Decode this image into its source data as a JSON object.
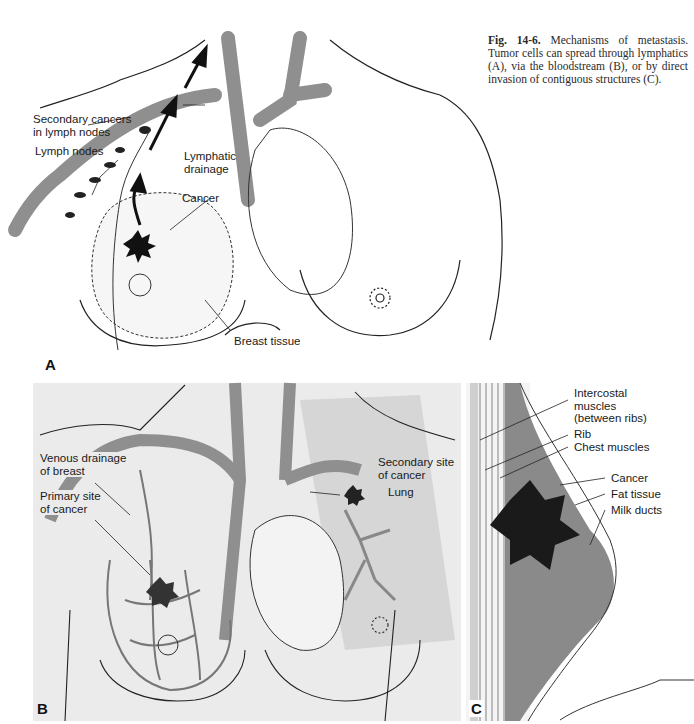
{
  "figure": {
    "number": "Fig. 14-6.",
    "caption": "Mechanisms of metastasis. Tumor cells can spread through lymphatics (A), via the bloodstream (B), or by direct invasion of contiguous structures (C)."
  },
  "panels": {
    "A": {
      "letter": "A",
      "labels": {
        "secondary_cancers_1": "Secondary cancers",
        "secondary_cancers_2": "in lymph nodes",
        "lymph_nodes": "Lymph nodes",
        "lymphatic_1": "Lymphatic",
        "lymphatic_2": "drainage",
        "cancer": "Cancer",
        "breast_tissue": "Breast tissue"
      }
    },
    "B": {
      "letter": "B",
      "labels": {
        "venous_1": "Venous drainage",
        "venous_2": "of breast",
        "primary_1": "Primary site",
        "primary_2": "of cancer",
        "secondary_1": "Secondary site",
        "secondary_2": "of cancer",
        "lung": "Lung"
      }
    },
    "C": {
      "letter": "C",
      "labels": {
        "intercostal_1": "Intercostal",
        "intercostal_2": "muscles",
        "intercostal_3": "(between ribs)",
        "rib": "Rib",
        "chest_muscles": "Chest muscles",
        "cancer": "Cancer",
        "fat_tissue": "Fat tissue",
        "milk_ducts": "Milk ducts"
      }
    }
  },
  "colors": {
    "vessel": "#8f8f8f",
    "panel_bg": "#ebebeb",
    "lung_shade": "#d6d6d6",
    "tumor": "#1a1a1a",
    "breast_tissue_c": "#8a8a8a"
  }
}
